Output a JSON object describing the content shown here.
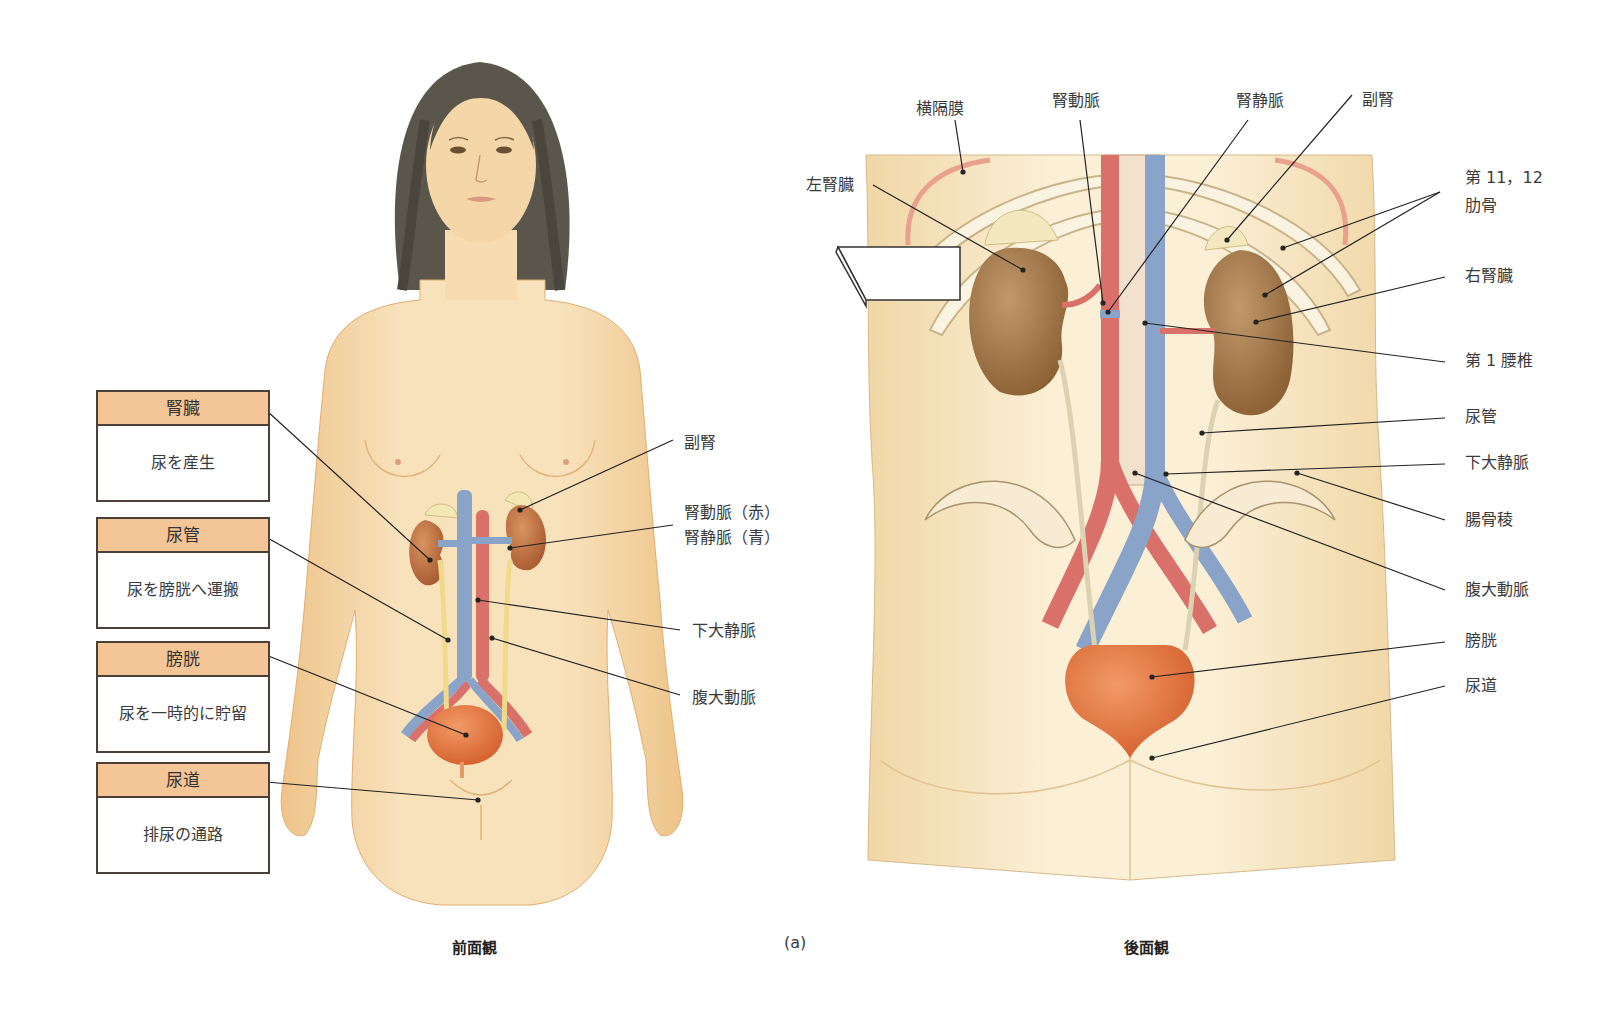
{
  "figure": {
    "panel_label": "(a)",
    "front_caption": "前面観",
    "back_caption": "後面観"
  },
  "front_view": {
    "function_boxes": [
      {
        "organ": "腎臓",
        "function": "尿を産生"
      },
      {
        "organ": "尿管",
        "function": "尿を膀胱へ運搬"
      },
      {
        "organ": "膀胱",
        "function": "尿を一時的に貯留"
      },
      {
        "organ": "尿道",
        "function": "排尿の通路"
      }
    ],
    "labels": {
      "adrenal": "副腎",
      "renal_artery": "腎動脈（赤）",
      "renal_vein": "腎静脈（青）",
      "ivc": "下大静脈",
      "aorta": "腹大動脈"
    }
  },
  "back_view": {
    "labels": {
      "diaphragm": "横隔膜",
      "renal_artery": "腎動脈",
      "renal_vein": "腎静脈",
      "adrenal": "副腎",
      "left_kidney": "左腎臓",
      "ribs_line1": "第 11，12",
      "ribs_line2": "肋骨",
      "right_kidney": "右腎臓",
      "l1_vertebra": "第 1 腰椎",
      "ureter": "尿管",
      "ivc": "下大静脈",
      "iliac_crest": "腸骨稜",
      "aorta": "腹大動脈",
      "bladder": "膀胱",
      "urethra": "尿道"
    }
  },
  "colors": {
    "skin": "#f5d9a8",
    "skin_dark": "#e8bf84",
    "kidney": "#b86a3c",
    "kidney_back": "#9c7044",
    "artery": "#d9706a",
    "vein": "#8aa3c8",
    "ureter": "#efd98a",
    "bladder": "#e0763f",
    "box_header": "#f4c596",
    "hair": "#5a564c"
  }
}
